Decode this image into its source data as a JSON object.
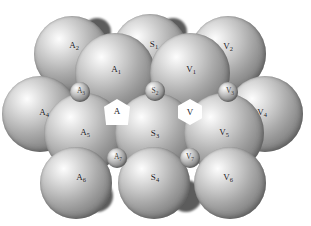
{
  "figure": {
    "background_color": "#ffffff",
    "sphere_color_light": "#fdfdfd",
    "sphere_color_dark": "#666666",
    "label_color": "#20201f",
    "vacancy_color": "#ffffff",
    "width": 311,
    "height": 226
  },
  "spheres": [
    {
      "id": "A2",
      "label": "A",
      "sub": "2",
      "cx": 72,
      "cy": 54,
      "r": 38,
      "size": "large",
      "label_x": 74,
      "label_y": 45,
      "label_size": "normal",
      "layer": 1
    },
    {
      "id": "S1",
      "label": "S",
      "sub": "1",
      "cx": 150,
      "cy": 52,
      "r": 38,
      "size": "large",
      "label_x": 154,
      "label_y": 44,
      "label_size": "normal",
      "layer": 1
    },
    {
      "id": "V2",
      "label": "V",
      "sub": "2",
      "cx": 228,
      "cy": 54,
      "r": 38,
      "size": "large",
      "label_x": 228,
      "label_y": 46,
      "label_size": "normal",
      "layer": 1
    },
    {
      "id": "A1",
      "label": "A",
      "sub": "1",
      "cx": 115,
      "cy": 73,
      "r": 40,
      "size": "large",
      "label_x": 116,
      "label_y": 69,
      "label_size": "normal",
      "layer": 2
    },
    {
      "id": "V1",
      "label": "V",
      "sub": "1",
      "cx": 190,
      "cy": 73,
      "r": 40,
      "size": "large",
      "label_x": 191,
      "label_y": 69,
      "label_size": "normal",
      "layer": 2
    },
    {
      "id": "A4",
      "label": "A",
      "sub": "4",
      "cx": 40,
      "cy": 114,
      "r": 38,
      "size": "large",
      "label_x": 44,
      "label_y": 112,
      "label_size": "normal",
      "layer": 2
    },
    {
      "id": "V4",
      "label": "V",
      "sub": "4",
      "cx": 265,
      "cy": 114,
      "r": 38,
      "size": "large",
      "label_x": 262,
      "label_y": 112,
      "label_size": "normal",
      "layer": 2
    },
    {
      "id": "A5",
      "label": "A",
      "sub": "5",
      "cx": 84,
      "cy": 133,
      "r": 40,
      "size": "large",
      "label_x": 85,
      "label_y": 132,
      "label_size": "normal",
      "layer": 3
    },
    {
      "id": "S3",
      "label": "S",
      "sub": "3",
      "cx": 155,
      "cy": 133,
      "r": 40,
      "size": "large",
      "label_x": 155,
      "label_y": 133,
      "label_size": "normal",
      "layer": 3
    },
    {
      "id": "V5",
      "label": "V",
      "sub": "5",
      "cx": 224,
      "cy": 133,
      "r": 40,
      "size": "large",
      "label_x": 224,
      "label_y": 132,
      "label_size": "normal",
      "layer": 3
    },
    {
      "id": "A6",
      "label": "A",
      "sub": "6",
      "cx": 76,
      "cy": 183,
      "r": 36,
      "size": "large",
      "label_x": 81,
      "label_y": 177,
      "label_size": "normal",
      "layer": 4
    },
    {
      "id": "S4",
      "label": "S",
      "sub": "4",
      "cx": 154,
      "cy": 183,
      "r": 36,
      "size": "large",
      "label_x": 155,
      "label_y": 177,
      "label_size": "normal",
      "layer": 4
    },
    {
      "id": "V6",
      "label": "V",
      "sub": "6",
      "cx": 230,
      "cy": 183,
      "r": 36,
      "size": "large",
      "label_x": 228,
      "label_y": 177,
      "label_size": "normal",
      "layer": 4
    },
    {
      "id": "A3",
      "label": "A",
      "sub": "3",
      "cx": 80,
      "cy": 92,
      "r": 10,
      "size": "small",
      "label_x": 81,
      "label_y": 91,
      "label_size": "small",
      "layer": 5
    },
    {
      "id": "S2",
      "label": "S",
      "sub": "2",
      "cx": 155,
      "cy": 91,
      "r": 10,
      "size": "small",
      "label_x": 155,
      "label_y": 91,
      "label_size": "small",
      "layer": 5
    },
    {
      "id": "V3",
      "label": "V",
      "sub": "3",
      "cx": 228,
      "cy": 92,
      "r": 10,
      "size": "small",
      "label_x": 230,
      "label_y": 91,
      "label_size": "small",
      "layer": 5
    },
    {
      "id": "A7",
      "label": "A",
      "sub": "7",
      "cx": 117,
      "cy": 158,
      "r": 10,
      "size": "small",
      "label_x": 118,
      "label_y": 157,
      "label_size": "small",
      "layer": 5
    },
    {
      "id": "V7",
      "label": "V",
      "sub": "7",
      "cx": 190,
      "cy": 158,
      "r": 10,
      "size": "small",
      "label_x": 190,
      "label_y": 157,
      "label_size": "small",
      "layer": 5
    }
  ],
  "vacancies": [
    {
      "id": "V",
      "label": "V",
      "sub": "",
      "cx": 190,
      "cy": 112,
      "w": 24,
      "h": 26,
      "label_x": 190,
      "label_y": 112,
      "shape": "hexagon"
    },
    {
      "id": "A",
      "label": "A",
      "sub": "",
      "cx": 117,
      "cy": 112,
      "w": 26,
      "h": 26,
      "label_x": 117,
      "label_y": 111,
      "shape": "triangle-gap"
    }
  ],
  "legend": {
    "a_sites": [
      "A",
      "A1",
      "A2",
      "A3",
      "A4",
      "A5",
      "A6",
      "A7"
    ],
    "s_sites": [
      "S1",
      "S2",
      "S3",
      "S4"
    ],
    "v_sites": [
      "V",
      "V1",
      "V2",
      "V3",
      "V4",
      "V5",
      "V6",
      "V7"
    ]
  }
}
